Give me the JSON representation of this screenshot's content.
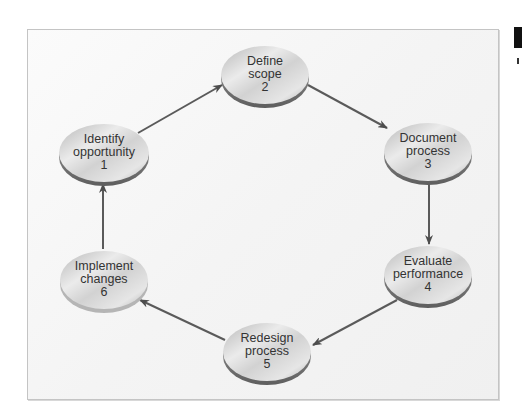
{
  "diagram": {
    "type": "cycle",
    "colors": {
      "arrow": "#555555",
      "node_fill_light": "#e8e8e8",
      "node_fill_dark": "#a9a9a9",
      "node_rim": "#7a7a7a",
      "text": "#333333",
      "frame_border": "#c4c4c4"
    },
    "nodes": [
      {
        "id": 1,
        "line1": "Identify",
        "line2": "opportunity",
        "number": "1"
      },
      {
        "id": 2,
        "line1": "Define",
        "line2": "scope",
        "number": "2"
      },
      {
        "id": 3,
        "line1": "Document",
        "line2": "process",
        "number": "3"
      },
      {
        "id": 4,
        "line1": "Evaluate",
        "line2": "performance",
        "number": "4"
      },
      {
        "id": 5,
        "line1": "Redesign",
        "line2": "process",
        "number": "5"
      },
      {
        "id": 6,
        "line1": "Implement",
        "line2": "changes",
        "number": "6"
      }
    ],
    "edges": [
      {
        "from": 1,
        "to": 2
      },
      {
        "from": 2,
        "to": 3
      },
      {
        "from": 3,
        "to": 4
      },
      {
        "from": 4,
        "to": 5
      },
      {
        "from": 5,
        "to": 6
      },
      {
        "from": 6,
        "to": 1
      }
    ]
  }
}
